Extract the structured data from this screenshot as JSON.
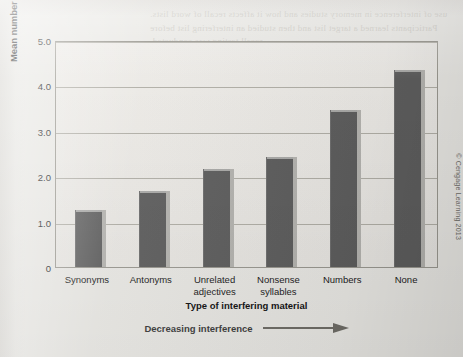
{
  "figure": {
    "credit": "© Cengage Learning 2013",
    "bleed_text": "use of interference in memory studies and how it affects recall of word lists. Participants learned a target list and then studied an interfering list before recall testing was conducted."
  },
  "chart_data": {
    "type": "bar",
    "title": "",
    "xlabel": "Type of interfering material",
    "ylabel": "Mean number of test items recalled",
    "categories": [
      "Synonyms",
      "Antonyms",
      "Unrelated adjectives",
      "Nonsense syllables",
      "Numbers",
      "None"
    ],
    "category_lines": [
      [
        "Synonyms"
      ],
      [
        "Antonyms"
      ],
      [
        "Unrelated",
        "adjectives"
      ],
      [
        "Nonsense",
        "syllables"
      ],
      [
        "Numbers"
      ],
      [
        "None"
      ]
    ],
    "values": [
      1.25,
      1.68,
      2.15,
      2.42,
      3.45,
      4.35
    ],
    "ylim": [
      0,
      5.0
    ],
    "yticks": [
      0,
      1.0,
      2.0,
      3.0,
      4.0,
      5.0
    ],
    "ytick_labels": [
      "0",
      "1.0",
      "2.0",
      "3.0",
      "4.0",
      "5.0"
    ],
    "grid": true,
    "legend": "none",
    "bar_color": "#5d5d5d",
    "annotation": {
      "text": "Decreasing interference",
      "arrow": "right-arrow"
    }
  }
}
